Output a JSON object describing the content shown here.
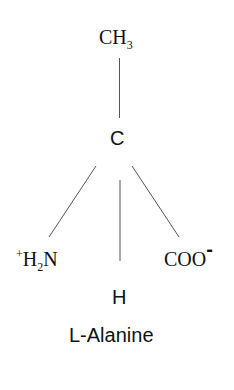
{
  "diagram": {
    "title": "L-Alanine",
    "atoms": {
      "top": {
        "main": "CH",
        "sub": "3"
      },
      "center": "C",
      "left": {
        "sup": "+",
        "h": "H",
        "sub": "2",
        "n": "N"
      },
      "right": {
        "main": "COO",
        "charge": "-"
      },
      "bottom": "H"
    },
    "bonds": [
      {
        "from": "center",
        "to": "top"
      },
      {
        "from": "center",
        "to": "left"
      },
      {
        "from": "center",
        "to": "right"
      },
      {
        "from": "center",
        "to": "bottom"
      }
    ],
    "colors": {
      "line": "#555555",
      "text": "#111111",
      "background": "#ffffff"
    }
  }
}
